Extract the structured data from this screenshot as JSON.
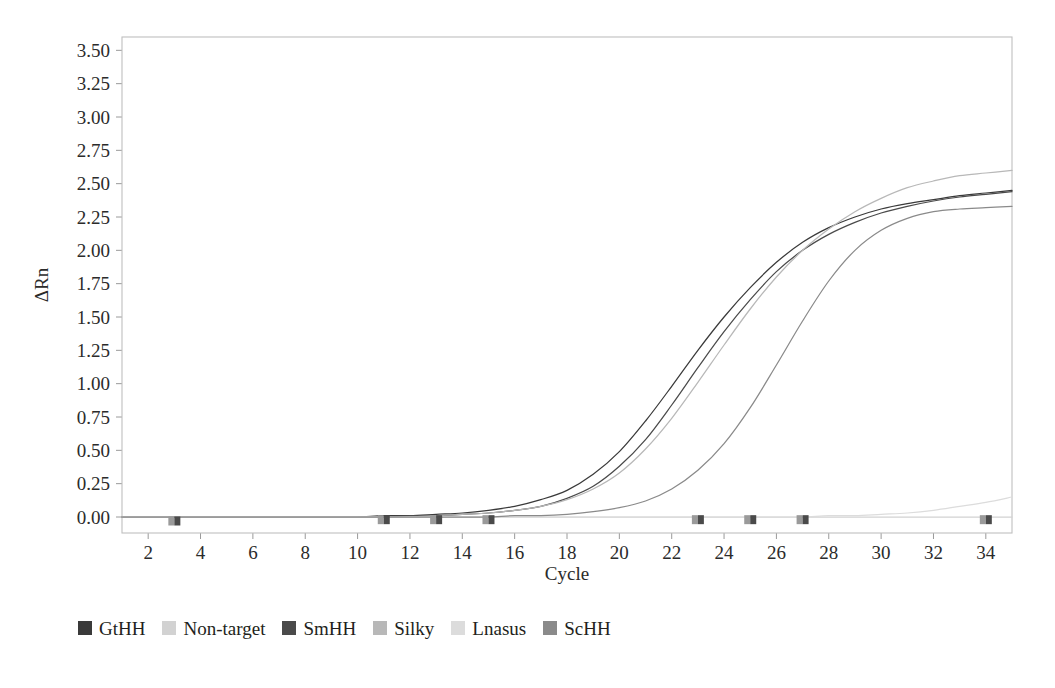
{
  "chart_data": {
    "type": "line",
    "title": "",
    "xlabel": "Cycle",
    "ylabel": "ΔRn",
    "xlim": [
      1,
      35
    ],
    "ylim": [
      -0.12,
      3.6
    ],
    "grid": false,
    "legend_position": "below-plot",
    "x_ticks": [
      2,
      4,
      6,
      8,
      10,
      12,
      14,
      16,
      18,
      20,
      22,
      24,
      26,
      28,
      30,
      32,
      34
    ],
    "y_ticks": [
      "0.00",
      "0.25",
      "0.50",
      "0.75",
      "1.00",
      "1.25",
      "1.50",
      "1.75",
      "2.00",
      "2.25",
      "2.50",
      "2.75",
      "3.00",
      "3.25",
      "3.50"
    ],
    "x": [
      1,
      2,
      3,
      4,
      5,
      6,
      7,
      8,
      9,
      10,
      11,
      12,
      13,
      14,
      15,
      16,
      17,
      18,
      19,
      20,
      21,
      22,
      23,
      24,
      25,
      26,
      27,
      28,
      29,
      30,
      31,
      32,
      33,
      34,
      35
    ],
    "series": [
      {
        "name": "GtHH",
        "color": "#3a3a3a",
        "marker": "square",
        "values": [
          0.0,
          0.0,
          0.0,
          0.0,
          0.0,
          0.0,
          0.0,
          0.0,
          0.0,
          0.0,
          0.01,
          0.01,
          0.02,
          0.03,
          0.05,
          0.08,
          0.13,
          0.2,
          0.32,
          0.49,
          0.72,
          0.98,
          1.25,
          1.5,
          1.72,
          1.91,
          2.06,
          2.17,
          2.25,
          2.31,
          2.35,
          2.38,
          2.41,
          2.43,
          2.45
        ]
      },
      {
        "name": "Non-target",
        "color": "#d2d2d2",
        "marker": "square",
        "values": [
          0.0,
          0.0,
          0.0,
          0.0,
          0.0,
          0.0,
          0.0,
          0.0,
          0.0,
          0.0,
          0.0,
          0.0,
          0.0,
          0.0,
          0.0,
          0.0,
          0.0,
          0.0,
          0.0,
          0.0,
          0.0,
          0.0,
          0.0,
          0.0,
          0.0,
          0.0,
          0.0,
          0.0,
          0.0,
          0.0,
          0.0,
          0.0,
          0.0,
          0.0,
          0.0
        ]
      },
      {
        "name": "SmHH",
        "color": "#4a4a4a",
        "marker": "square",
        "values": [
          0.0,
          0.0,
          0.0,
          0.0,
          0.0,
          0.0,
          0.0,
          0.0,
          0.0,
          0.0,
          0.0,
          0.01,
          0.01,
          0.02,
          0.03,
          0.05,
          0.08,
          0.14,
          0.23,
          0.38,
          0.58,
          0.84,
          1.12,
          1.39,
          1.63,
          1.84,
          2.0,
          2.12,
          2.21,
          2.28,
          2.33,
          2.37,
          2.4,
          2.42,
          2.44
        ]
      },
      {
        "name": "Silky",
        "color": "#b8b8b8",
        "marker": "square",
        "values": [
          0.0,
          0.0,
          0.0,
          0.0,
          0.0,
          0.0,
          0.0,
          0.0,
          0.0,
          0.0,
          0.0,
          0.0,
          0.01,
          0.02,
          0.03,
          0.05,
          0.08,
          0.13,
          0.21,
          0.33,
          0.51,
          0.74,
          1.01,
          1.29,
          1.56,
          1.8,
          2.0,
          2.16,
          2.29,
          2.39,
          2.47,
          2.52,
          2.56,
          2.58,
          2.6
        ]
      },
      {
        "name": "Lnasus",
        "color": "#dcdcdc",
        "marker": "square",
        "values": [
          0.0,
          0.0,
          0.0,
          0.0,
          0.0,
          0.0,
          0.0,
          0.0,
          0.0,
          0.0,
          0.0,
          0.0,
          0.0,
          0.0,
          0.0,
          0.0,
          0.0,
          0.0,
          0.0,
          0.0,
          0.0,
          0.0,
          0.0,
          0.0,
          0.0,
          0.0,
          0.0,
          0.01,
          0.01,
          0.02,
          0.03,
          0.05,
          0.08,
          0.11,
          0.15
        ]
      },
      {
        "name": "ScHH",
        "color": "#8a8a8a",
        "marker": "square",
        "values": [
          0.0,
          0.0,
          0.0,
          0.0,
          0.0,
          0.0,
          0.0,
          0.0,
          0.0,
          0.0,
          0.0,
          0.0,
          0.0,
          0.0,
          0.0,
          0.01,
          0.01,
          0.02,
          0.04,
          0.07,
          0.12,
          0.21,
          0.35,
          0.55,
          0.82,
          1.14,
          1.47,
          1.77,
          2.0,
          2.15,
          2.24,
          2.29,
          2.31,
          2.32,
          2.33
        ]
      }
    ],
    "baseline_markers": [
      {
        "x": 3,
        "y": -0.03
      },
      {
        "x": 11,
        "y": -0.02
      },
      {
        "x": 13,
        "y": -0.02
      },
      {
        "x": 15,
        "y": -0.02
      },
      {
        "x": 23,
        "y": -0.02
      },
      {
        "x": 25,
        "y": -0.02
      },
      {
        "x": 27,
        "y": -0.02
      },
      {
        "x": 34,
        "y": -0.02
      }
    ]
  },
  "legend": {
    "items": [
      {
        "label": "GtHH",
        "color": "#3a3a3a"
      },
      {
        "label": "Non-target",
        "color": "#d2d2d2"
      },
      {
        "label": "SmHH",
        "color": "#4a4a4a"
      },
      {
        "label": "Silky",
        "color": "#b8b8b8"
      },
      {
        "label": "Lnasus",
        "color": "#dcdcdc"
      },
      {
        "label": "ScHH",
        "color": "#8a8a8a"
      }
    ]
  },
  "axes": {
    "x_title": "Cycle",
    "y_title": "ΔRn"
  }
}
